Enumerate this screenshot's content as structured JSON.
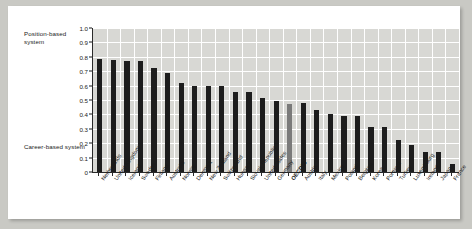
{
  "chart_data": {
    "type": "bar",
    "title": "",
    "subtitle": "",
    "xlabel": "",
    "ylabel": "",
    "ylim": [
      0,
      1.0
    ],
    "grid": true,
    "legend": "none",
    "y_ticks": [
      "1.0",
      "0.9",
      "0.8",
      "0.7",
      "0.6",
      "0.5",
      "0.4",
      "0.3",
      "0.2",
      "0.1",
      "0"
    ],
    "y_tick_values": [
      1.0,
      0.9,
      0.8,
      0.7,
      0.6,
      0.5,
      0.4,
      0.3,
      0.2,
      0.1,
      0
    ],
    "annotations": [
      {
        "text": "Position-based system",
        "position": "top-left-outside"
      },
      {
        "text": "Career-based system",
        "position": "bottom-left-outside"
      }
    ],
    "highlight_category": "OECD26",
    "colors": {
      "bar": "#1d1d1d",
      "bar_highlight": "#7a7a7a",
      "plot_background": "#d8d8d4",
      "gridline": "#ffffff",
      "axis": "#2a2a2a",
      "card_background": "#ffffff",
      "page_background": "#c9c9c4",
      "text": "#1a1a1a"
    },
    "categories": [
      "Netherlands",
      "United Kingdom",
      "Iceland",
      "Sweden",
      "Finland",
      "Australia",
      "Norway",
      "Denmark",
      "New Zealand",
      "Switzerland",
      "Hungary",
      "Slovak Republic",
      "United States",
      "Germany",
      "OECD26",
      "Austria",
      "Italy",
      "Mexico",
      "Poland",
      "Belgium",
      "Korea",
      "Portugal",
      "Turkey",
      "Luxembourg",
      "Ireland",
      "Japan",
      "France"
    ],
    "values": [
      0.785,
      0.775,
      0.77,
      0.77,
      0.72,
      0.69,
      0.615,
      0.595,
      0.595,
      0.595,
      0.555,
      0.555,
      0.515,
      0.49,
      0.475,
      0.48,
      0.43,
      0.4,
      0.39,
      0.39,
      0.315,
      0.315,
      0.225,
      0.185,
      0.14,
      0.14,
      0.055
    ]
  }
}
